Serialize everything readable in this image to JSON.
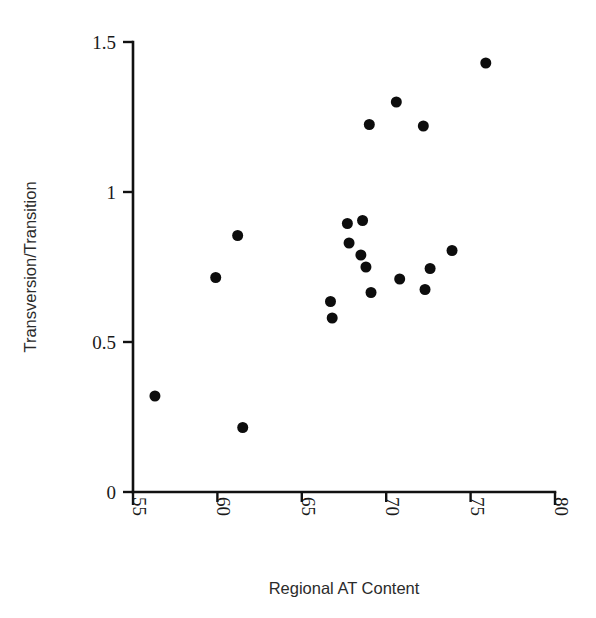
{
  "chart_data": {
    "type": "scatter",
    "title": "",
    "xlabel": "Regional AT Content",
    "ylabel": "Transversion/Transition",
    "xlim": [
      55,
      80
    ],
    "ylim": [
      0,
      1.5
    ],
    "xticks": [
      55,
      60,
      65,
      70,
      75,
      80
    ],
    "yticks": [
      0,
      0.5,
      1,
      1.5
    ],
    "xtick_labels": [
      "55",
      "60",
      "65",
      "70",
      "75",
      "80"
    ],
    "ytick_labels": [
      "0",
      "0.5",
      "1",
      "1.5"
    ],
    "xtick_rotation": 90,
    "grid": false,
    "legend": false,
    "marker": "filled-circle",
    "marker_color": "#0d0d0d",
    "marker_size": 11,
    "n_points": 20,
    "points": [
      {
        "x": 56.3,
        "y": 0.32
      },
      {
        "x": 59.9,
        "y": 0.715
      },
      {
        "x": 61.2,
        "y": 0.855
      },
      {
        "x": 61.5,
        "y": 0.215
      },
      {
        "x": 66.7,
        "y": 0.635
      },
      {
        "x": 66.8,
        "y": 0.58
      },
      {
        "x": 67.7,
        "y": 0.895
      },
      {
        "x": 67.8,
        "y": 0.83
      },
      {
        "x": 68.5,
        "y": 0.79
      },
      {
        "x": 68.6,
        "y": 0.905
      },
      {
        "x": 68.8,
        "y": 0.75
      },
      {
        "x": 69.0,
        "y": 1.225
      },
      {
        "x": 69.1,
        "y": 0.665
      },
      {
        "x": 70.6,
        "y": 1.3
      },
      {
        "x": 70.8,
        "y": 0.71
      },
      {
        "x": 72.2,
        "y": 1.22
      },
      {
        "x": 72.3,
        "y": 0.675
      },
      {
        "x": 72.6,
        "y": 0.745
      },
      {
        "x": 73.9,
        "y": 0.805
      },
      {
        "x": 75.9,
        "y": 1.43
      }
    ]
  },
  "axes": {
    "x_axis_name": "x-axis",
    "y_axis_name": "y-axis"
  }
}
